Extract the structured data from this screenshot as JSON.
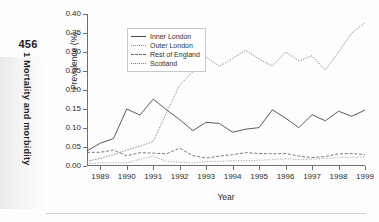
{
  "page": {
    "folio": "456",
    "running_head": "1 Mortality and morbidity"
  },
  "chart_data": {
    "type": "line",
    "title": "",
    "xlabel": "Year",
    "ylabel": "Prevalence (%)",
    "xlim": [
      1988.5,
      1999.0
    ],
    "ylim": [
      0.0,
      0.4
    ],
    "grid": false,
    "legend_position": "top-left",
    "x_tick_labels": [
      "1989",
      "1990",
      "1991",
      "1992",
      "1993",
      "1994",
      "1995",
      "1996",
      "1997",
      "1998",
      "1999"
    ],
    "x_ticks": [
      1989,
      1990,
      1991,
      1992,
      1993,
      1994,
      1995,
      1996,
      1997,
      1998,
      1999
    ],
    "y_tick_labels": [
      "0.00",
      "0.05",
      "0.10",
      "0.15",
      "0.20",
      "0.25",
      "0.30",
      "0.35",
      "0.40"
    ],
    "y_ticks": [
      0.0,
      0.05,
      0.1,
      0.15,
      0.2,
      0.25,
      0.3,
      0.35,
      0.4
    ],
    "x": [
      1988.5,
      1989.0,
      1989.5,
      1990.0,
      1990.5,
      1991.0,
      1991.5,
      1992.0,
      1992.5,
      1993.0,
      1993.5,
      1994.0,
      1994.5,
      1995.0,
      1995.5,
      1996.0,
      1996.5,
      1997.0,
      1997.5,
      1998.0,
      1998.5,
      1999.0
    ],
    "series": [
      {
        "name": "Inner London",
        "style": "solid",
        "color": "#4a4a4a",
        "values": [
          0.04,
          0.06,
          0.072,
          0.15,
          0.134,
          0.176,
          0.148,
          0.122,
          0.093,
          0.115,
          0.112,
          0.089,
          0.097,
          0.101,
          0.148,
          0.126,
          0.101,
          0.135,
          0.119,
          0.144,
          0.131,
          0.147
        ]
      },
      {
        "name": "Outer London",
        "style": "dotted-fine",
        "color": "#8f8f8f",
        "values": [
          0.006,
          0.008,
          0.008,
          0.008,
          0.018,
          0.026,
          0.012,
          0.01,
          0.008,
          0.012,
          0.012,
          0.014,
          0.014,
          0.015,
          0.017,
          0.019,
          0.017,
          0.018,
          0.02,
          0.022,
          0.023,
          0.024
        ]
      },
      {
        "name": "Rest of England",
        "style": "dashed",
        "color": "#6b6b6b",
        "values": [
          0.036,
          0.036,
          0.042,
          0.027,
          0.035,
          0.034,
          0.032,
          0.047,
          0.027,
          0.021,
          0.026,
          0.03,
          0.035,
          0.033,
          0.032,
          0.033,
          0.026,
          0.022,
          0.025,
          0.032,
          0.033,
          0.03
        ]
      },
      {
        "name": "Scotland",
        "style": "dotted",
        "color": "#7d7d7d",
        "values": [
          0.012,
          0.02,
          0.03,
          0.042,
          0.052,
          0.064,
          0.14,
          0.213,
          0.248,
          0.287,
          0.262,
          0.283,
          0.305,
          0.281,
          0.263,
          0.3,
          0.277,
          0.29,
          0.252,
          0.3,
          0.35,
          0.377
        ]
      }
    ]
  }
}
